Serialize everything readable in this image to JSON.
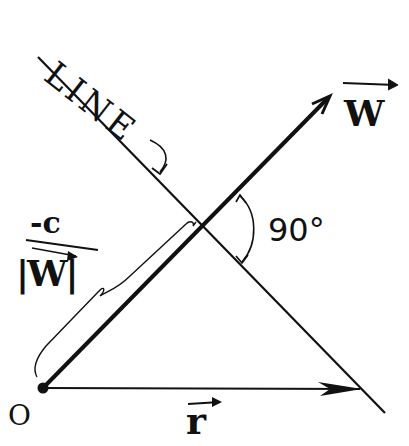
{
  "diagram": {
    "line_label": "LINE",
    "vector_w_label": "W",
    "vector_r_label": "r",
    "origin_label": "O",
    "angle_label": "90°",
    "distance_numerator": "-c",
    "distance_denominator": "|W|",
    "colors": {
      "ink": "#111111",
      "background": "#ffffff"
    }
  }
}
